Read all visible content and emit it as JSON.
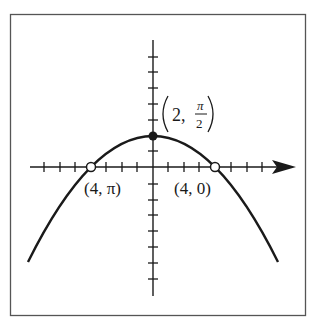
{
  "figure": {
    "type": "polar point plot on rectangular axes",
    "curve": "downward-opening parabola",
    "colors": {
      "ink": "#1a1a1a",
      "frame": "#555555",
      "background": "#ffffff"
    }
  },
  "points": [
    {
      "label_coord": "2",
      "label_angle_num": "π",
      "label_angle_den": "2",
      "kind": "filled",
      "position": "vertex on y-axis"
    },
    {
      "label": "(4, π)",
      "kind": "open",
      "position": "left x-intercept"
    },
    {
      "label": "(4, 0)",
      "kind": "open",
      "position": "right x-intercept"
    }
  ],
  "labels": {
    "vertex_r": "2,",
    "vertex_num": "π",
    "vertex_den": "2",
    "left_intercept": "(4, π)",
    "right_intercept": "(4, 0)"
  },
  "axes": {
    "x_ticks_left": 7,
    "x_ticks_right": 7,
    "y_ticks_above": 6,
    "y_ticks_below": 7,
    "x_arrow": true
  }
}
